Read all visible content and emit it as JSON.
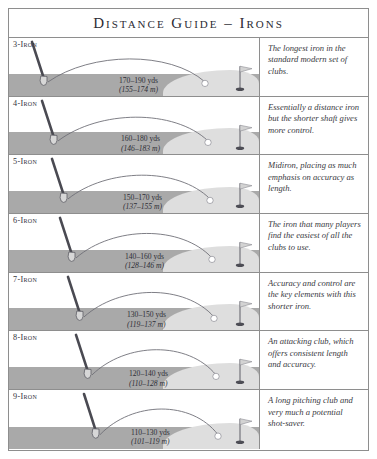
{
  "title": "Distance Guide – Irons",
  "colors": {
    "frame_border": "#8e8e8e",
    "ground": "#a9a9a9",
    "green": "#dedede",
    "trajectory": "#6f6f77",
    "text": "#2f2f37",
    "flag": "#c9c9c9"
  },
  "columns": {
    "club_label": "Club",
    "diagram": "Ball flight diagram",
    "description": "Description"
  },
  "rows": [
    {
      "club": "3-Iron",
      "yards": "170–190 yds",
      "metres": "(155–174 m)",
      "description": "The longest iron in the standard modern set of clubs.",
      "carry_low_yds": 170,
      "carry_high_yds": 190,
      "carry_low_m": 155,
      "carry_high_m": 174
    },
    {
      "club": "4-Iron",
      "yards": "160–180 yds",
      "metres": "(146–183 m)",
      "description": "Essentially a distance iron but the shorter shaft gives more control.",
      "carry_low_yds": 160,
      "carry_high_yds": 180,
      "carry_low_m": 146,
      "carry_high_m": 183
    },
    {
      "club": "5-Iron",
      "yards": "150–170 yds",
      "metres": "(137–155 m)",
      "description": "Midiron, placing as much emphasis on accuracy as length.",
      "carry_low_yds": 150,
      "carry_high_yds": 170,
      "carry_low_m": 137,
      "carry_high_m": 155
    },
    {
      "club": "6-Iron",
      "yards": "140–160 yds",
      "metres": "(128–146 m)",
      "description": "The iron that many players find the easiest of all the clubs to use.",
      "carry_low_yds": 140,
      "carry_high_yds": 160,
      "carry_low_m": 128,
      "carry_high_m": 146
    },
    {
      "club": "7-Iron",
      "yards": "130–150 yds",
      "metres": "(119–137 m)",
      "description": "Accuracy and control are the key elements with this shorter iron.",
      "carry_low_yds": 130,
      "carry_high_yds": 150,
      "carry_low_m": 119,
      "carry_high_m": 137
    },
    {
      "club": "8-Iron",
      "yards": "120–140 yds",
      "metres": "(110–128 m)",
      "description": "An attacking club, which offers consistent length and accuracy.",
      "carry_low_yds": 120,
      "carry_high_yds": 140,
      "carry_low_m": 110,
      "carry_high_m": 128
    },
    {
      "club": "9-Iron",
      "yards": "110–130 yds",
      "metres": "(101–119 m)",
      "description": "A long pitching club and very much a potential shot-saver.",
      "carry_low_yds": 110,
      "carry_high_yds": 130,
      "carry_low_m": 101,
      "carry_high_m": 119
    }
  ]
}
